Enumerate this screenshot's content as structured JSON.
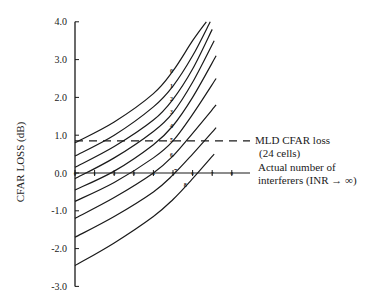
{
  "chart_data": {
    "type": "line",
    "title": "",
    "xlabel": "Actual number of interferers (INR → ∞)",
    "ylabel": "CFAR LOSS (dB)",
    "ylim": [
      -3.0,
      4.0
    ],
    "xlim": [
      0,
      8
    ],
    "grid": false,
    "legend": "none (curves labeled inline with assumed interferer count 0–8)",
    "y_ticks": [
      "4.0",
      "3.0",
      "2.0",
      "1.0",
      "0.0",
      "-1.0",
      "-2.0",
      "-3.0"
    ],
    "x_ticks": [
      "0",
      "1",
      "2",
      "3",
      "4",
      "5",
      "6",
      "7",
      "8"
    ],
    "reference_line": {
      "label": "MLD CFAR loss",
      "sublabel": "(24 cells)",
      "value": 0.85,
      "style": "dashed"
    },
    "series": [
      {
        "name": "0",
        "x": [
          0,
          2,
          4,
          5,
          6,
          6.7
        ],
        "values": [
          0.8,
          1.35,
          2.1,
          2.7,
          3.5,
          4.0
        ]
      },
      {
        "name": "1",
        "x": [
          0,
          2,
          4,
          5,
          6,
          6.9
        ],
        "values": [
          0.45,
          1.0,
          1.75,
          2.3,
          3.1,
          4.0
        ]
      },
      {
        "name": "2",
        "x": [
          0,
          2,
          4,
          5,
          6,
          7.0
        ],
        "values": [
          0.15,
          0.7,
          1.4,
          1.95,
          2.75,
          3.8
        ]
      },
      {
        "name": "3",
        "x": [
          0,
          2,
          4,
          5,
          6,
          7.1
        ],
        "values": [
          -0.15,
          0.4,
          1.1,
          1.6,
          2.4,
          3.5
        ]
      },
      {
        "name": "4",
        "x": [
          0,
          2,
          4,
          5,
          6,
          7.2
        ],
        "values": [
          -0.45,
          0.05,
          0.75,
          1.25,
          2.0,
          3.1
        ]
      },
      {
        "name": "5",
        "x": [
          0,
          2,
          4,
          5,
          6,
          7.2
        ],
        "values": [
          -0.75,
          -0.25,
          0.4,
          0.85,
          1.55,
          2.5
        ]
      },
      {
        "name": "6",
        "x": [
          0,
          2,
          4,
          5,
          6,
          7.2
        ],
        "values": [
          -1.2,
          -0.65,
          0.0,
          0.45,
          1.05,
          1.8
        ]
      },
      {
        "name": "7",
        "x": [
          0,
          2,
          4,
          5,
          6,
          7.2
        ],
        "values": [
          -1.7,
          -1.15,
          -0.5,
          -0.05,
          0.5,
          1.2
        ]
      },
      {
        "name": "8",
        "x": [
          0,
          2,
          4,
          5,
          6,
          7.1
        ],
        "values": [
          -2.45,
          -1.85,
          -1.15,
          -0.7,
          -0.15,
          0.5
        ]
      }
    ]
  },
  "labels": {
    "y_axis_title": "CFAR LOSS (dB)",
    "mld_line": "MLD CFAR loss",
    "mld_cells": "(24 cells)",
    "x_axis_line1": "Actual number of",
    "x_axis_line2": "interferers (INR → ∞)"
  }
}
